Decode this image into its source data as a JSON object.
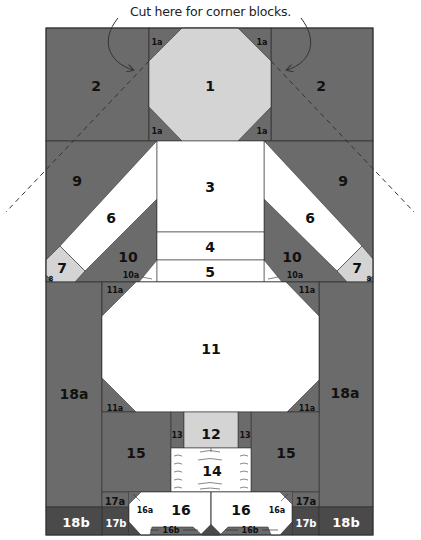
{
  "caption": "Cut here for corner blocks.",
  "colors": {
    "dark": "#6b6b6b",
    "darker": "#4a4a4a",
    "light": "#d4d4d4",
    "white": "#ffffff",
    "line": "#333333"
  },
  "labels": {
    "b1": "1",
    "b1a": "1a",
    "b2": "2",
    "b3": "3",
    "b4": "4",
    "b5": "5",
    "b6": "6",
    "b7": "7",
    "b8": "8",
    "b9": "9",
    "b10": "10",
    "b10a": "10a",
    "b11": "11",
    "b11a": "11a",
    "b12": "12",
    "b13": "13",
    "b14": "14",
    "b15": "15",
    "b16": "16",
    "b16a": "16a",
    "b16b": "16b",
    "b17a": "17a",
    "b17b": "17b",
    "b18a": "18a",
    "b18b": "18b"
  }
}
